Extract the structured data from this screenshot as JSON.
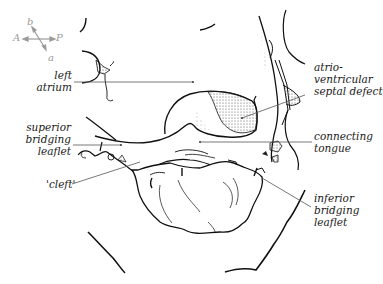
{
  "orientation": {
    "A": "A",
    "P": "P",
    "b": "b",
    "a": "a"
  },
  "labels": {
    "left_atrium": [
      "left",
      "atrium"
    ],
    "avsd": [
      "atrio-",
      "ventricular",
      "septal defect"
    ],
    "superior_bridging_leaflet": [
      "superior",
      "bridging",
      "leaflet"
    ],
    "connecting_tongue": [
      "connecting",
      "tongue"
    ],
    "cleft": "'cleft'",
    "inferior_bridging_leaflet": [
      "inferior",
      "bridging",
      "leaflet"
    ]
  },
  "colors": {
    "line": "#111111",
    "leader": "#555555",
    "compass": "#9a9a9a",
    "stipple": "#333333"
  }
}
